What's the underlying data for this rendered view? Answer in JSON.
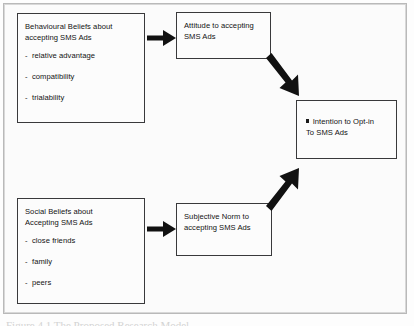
{
  "figure": {
    "background_color": "#fdfdfd",
    "frame_color": "#b9b9b9",
    "box_border_color": "#39393b",
    "arrow_color": "#111111",
    "text_color": "#121212",
    "caption_partial": "Figure 4.1 The Proposed Research Model"
  },
  "nodes": {
    "behavioural_beliefs": {
      "title": "Behavioural Beliefs about\naccepting SMS Ads",
      "bullets": [
        "relative advantage",
        "compatibility",
        "trialability"
      ],
      "bullet_marker": "-"
    },
    "social_beliefs": {
      "title": "Social Beliefs about\nAccepting SMS Ads",
      "bullets": [
        "close friends",
        "family",
        "peers"
      ],
      "bullet_marker": "-"
    },
    "attitude": {
      "title": "Attitude to accepting\nSMS Ads"
    },
    "subjective_norm": {
      "title": "Subjective Norm to\naccepting SMS Ads"
    },
    "intention": {
      "title": "Intention to Opt-in\nTo SMS Ads",
      "bullet_marker": "square"
    }
  },
  "arrows": [
    {
      "name": "behavioural-to-attitude",
      "from": "behavioural_beliefs",
      "to": "attitude",
      "direction": "right"
    },
    {
      "name": "social-to-subjective-norm",
      "from": "social_beliefs",
      "to": "subjective_norm",
      "direction": "right"
    },
    {
      "name": "attitude-to-intention",
      "from": "attitude",
      "to": "intention",
      "direction": "down-right"
    },
    {
      "name": "subjective-norm-to-intention",
      "from": "subjective_norm",
      "to": "intention",
      "direction": "up-right"
    }
  ]
}
